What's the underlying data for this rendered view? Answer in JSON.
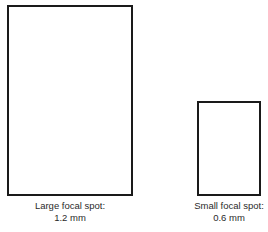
{
  "diagram": {
    "large": {
      "title": "Large focal spot:",
      "value": "1.2 mm"
    },
    "small": {
      "title": "Small focal spot:",
      "value": "0.6 mm"
    }
  }
}
